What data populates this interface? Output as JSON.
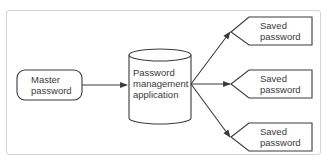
{
  "diagram": {
    "colors": {
      "stroke": "#3a3a3a",
      "frame_border": "#d4d4d4",
      "text": "#3a3a3a",
      "background": "#ffffff"
    },
    "nodes": [
      {
        "id": "master",
        "shape": "rounded-rect",
        "label_lines": [
          "Master",
          "password"
        ]
      },
      {
        "id": "app",
        "shape": "cylinder",
        "label_lines": [
          "Password",
          "management",
          "application"
        ]
      },
      {
        "id": "saved1",
        "shape": "pentagon-left",
        "label_lines": [
          "Saved",
          "password"
        ]
      },
      {
        "id": "saved2",
        "shape": "pentagon-left",
        "label_lines": [
          "Saved",
          "password"
        ]
      },
      {
        "id": "saved3",
        "shape": "pentagon-left",
        "label_lines": [
          "Saved",
          "password"
        ]
      }
    ],
    "edges": [
      {
        "from": "master",
        "to": "app"
      },
      {
        "from": "app",
        "to": "saved1"
      },
      {
        "from": "app",
        "to": "saved2"
      },
      {
        "from": "app",
        "to": "saved3"
      }
    ]
  }
}
